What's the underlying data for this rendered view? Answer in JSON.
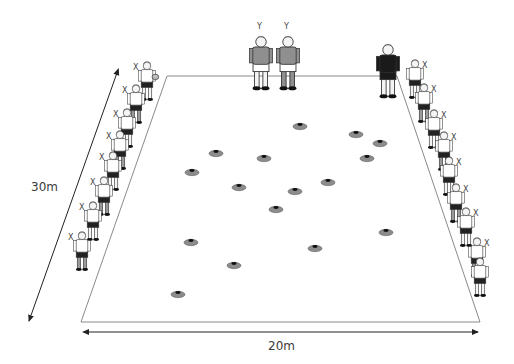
{
  "diagram": {
    "type": "drill-setup",
    "dimensions": {
      "width_label": "20m",
      "length_label": "30m"
    },
    "markers": {
      "defender": "Y",
      "attacker": "X"
    },
    "colors": {
      "field_line": "#8a8a8a",
      "arrow": "#222222",
      "cone_fill": "#8c8c8c",
      "cone_tip": "#111111",
      "shirt_grey": "#8f8f8f",
      "shirt_white": "#ffffff",
      "shorts_dark": "#222222",
      "coach_dark": "#1a1a1a"
    },
    "players_top": [
      {
        "role": "defender",
        "label": "Y"
      },
      {
        "role": "defender",
        "label": "Y"
      },
      {
        "role": "coach",
        "label": ""
      }
    ],
    "left_line": {
      "count": 8,
      "label": "X",
      "first_has_ball": true
    },
    "right_line": {
      "count": 9,
      "label": "X"
    },
    "cones": {
      "count": 18
    }
  }
}
